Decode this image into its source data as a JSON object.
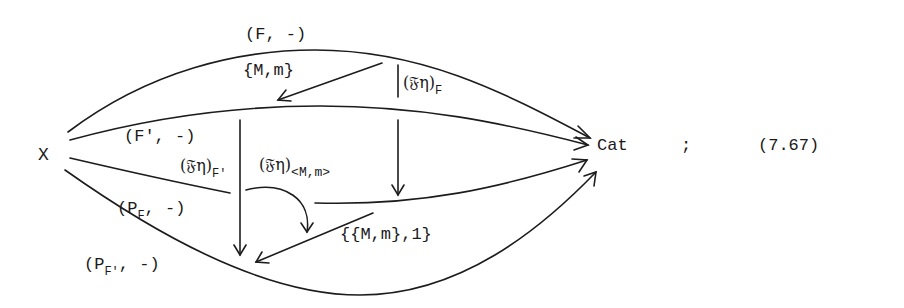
{
  "diagram": {
    "nodes": {
      "source": "X",
      "target": "Cat"
    },
    "punctuation": ";",
    "equation_number": "(7.67)",
    "arrows": {
      "f_functor": "(F, -)",
      "f_prime_functor": "(F', -)",
      "pf_functor_prefix": "(P",
      "pf_functor_sub": "F",
      "pf_functor_suffix": ", -)",
      "pf_prime_functor_prefix": "(P",
      "pf_prime_functor_sub": "F'",
      "pf_prime_functor_suffix": ", -)"
    },
    "two_cells": {
      "mm": "{M,m}",
      "feta_f_prefix": "(𝔉η)",
      "feta_f_sub": "F",
      "feta_fprime_prefix": "(𝔉η)",
      "feta_fprime_sub": "F'",
      "feta_mm_prefix": "(𝔉η)",
      "feta_mm_sub": "<M,m>",
      "mm_one": "{{M,m},1}"
    }
  },
  "colors": {
    "ink": "#1c1c1c",
    "paper": "#ffffff"
  }
}
